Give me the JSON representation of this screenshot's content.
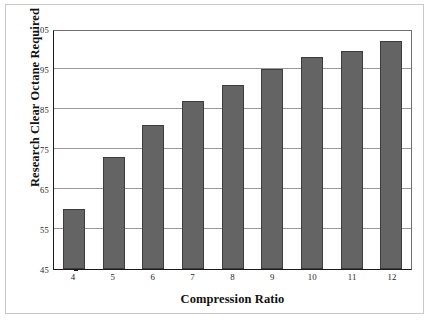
{
  "chart_data": {
    "type": "bar",
    "title": "",
    "xlabel": "Compression Ratio",
    "ylabel": "Research Clear Octane Required",
    "categories": [
      "4",
      "5",
      "6",
      "7",
      "8",
      "9",
      "10",
      "11",
      "12"
    ],
    "values": [
      60,
      73,
      81,
      87,
      91,
      95,
      98,
      99.5,
      102
    ],
    "ylim": [
      45,
      105
    ],
    "yticks": [
      45,
      55,
      65,
      75,
      85,
      95,
      105
    ],
    "ytick_labels": [
      "45",
      "55",
      "65",
      "75",
      "85",
      "95",
      "105"
    ],
    "grid": "horizontal",
    "legend": "none",
    "series": [
      {
        "name": "Research Clear Octane Required",
        "values": [
          60,
          73,
          81,
          87,
          91,
          95,
          98,
          99.5,
          102
        ]
      }
    ],
    "colors": {
      "bar_fill": "#646464",
      "bar_border": "#3d3d3d",
      "gridline": "#9a9a9a",
      "axis": "#1a1a1a",
      "background": "#ffffff",
      "frame": "#c9c9c9"
    }
  }
}
